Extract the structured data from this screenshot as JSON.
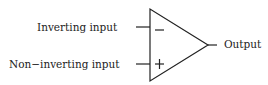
{
  "diagram": {
    "type": "op-amp-symbol",
    "labels": {
      "inverting_input": "Inverting input",
      "non_inverting_input": "Non−inverting input",
      "output": "Output"
    },
    "symbols": {
      "inverting_sign": "−",
      "non_inverting_sign": "+"
    },
    "colors": {
      "line": "#222222",
      "background": "#ffffff"
    }
  }
}
